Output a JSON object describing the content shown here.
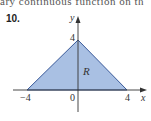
{
  "header": {
    "cut_text": "ary continuous function on th",
    "problem_number": "10."
  },
  "figure": {
    "region_label": "R",
    "axis_labels": {
      "x": "x",
      "y": "y"
    },
    "ticks": {
      "x_neg": "−4",
      "origin": "0",
      "x_pos": "4",
      "y_top": "4"
    },
    "colors": {
      "fill": "#a9c0e3",
      "edge": "#3a5a9a",
      "axis": "#333333"
    },
    "vertices": [
      [
        -4,
        0
      ],
      [
        4,
        0
      ],
      [
        0,
        4
      ]
    ]
  }
}
